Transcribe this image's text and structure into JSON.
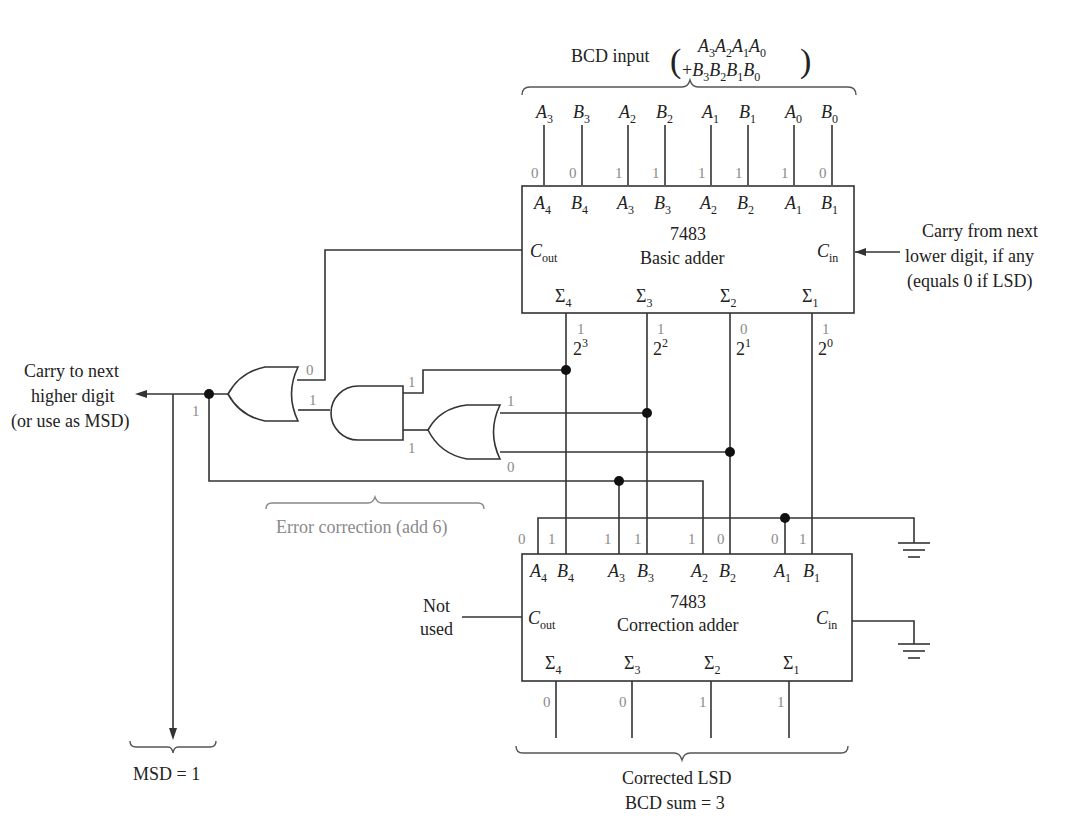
{
  "bcd_input": {
    "label": "BCD input",
    "line1": "A3A2A1A0",
    "line2": "+B3B2B1B0",
    "pins": [
      {
        "letter": "A",
        "sub": "3",
        "bit": "0"
      },
      {
        "letter": "B",
        "sub": "3",
        "bit": "0"
      },
      {
        "letter": "A",
        "sub": "2",
        "bit": "1"
      },
      {
        "letter": "B",
        "sub": "2",
        "bit": "1"
      },
      {
        "letter": "A",
        "sub": "1",
        "bit": "1"
      },
      {
        "letter": "B",
        "sub": "1",
        "bit": "1"
      },
      {
        "letter": "A",
        "sub": "0",
        "bit": "1"
      },
      {
        "letter": "B",
        "sub": "0",
        "bit": "0"
      }
    ]
  },
  "basic_adder": {
    "part": "7483",
    "name": "Basic adder",
    "cout": {
      "letter": "C",
      "sub": "out"
    },
    "cin": {
      "letter": "C",
      "sub": "in"
    },
    "inputs": [
      {
        "letter": "A",
        "sub": "4"
      },
      {
        "letter": "B",
        "sub": "4"
      },
      {
        "letter": "A",
        "sub": "3"
      },
      {
        "letter": "B",
        "sub": "3"
      },
      {
        "letter": "A",
        "sub": "2"
      },
      {
        "letter": "B",
        "sub": "2"
      },
      {
        "letter": "A",
        "sub": "1"
      },
      {
        "letter": "B",
        "sub": "1"
      }
    ],
    "outputs": [
      {
        "sigma_sub": "4",
        "bit": "1",
        "weight": "2",
        "exp": "3"
      },
      {
        "sigma_sub": "3",
        "bit": "1",
        "weight": "2",
        "exp": "2"
      },
      {
        "sigma_sub": "2",
        "bit": "0",
        "weight": "2",
        "exp": "1"
      },
      {
        "sigma_sub": "1",
        "bit": "1",
        "weight": "2",
        "exp": "0"
      }
    ],
    "cout_bit": "0"
  },
  "carry_in_note": {
    "line1": "Carry from next",
    "line2": "lower digit, if any",
    "line3": "(equals 0 if LSD)"
  },
  "carry_out_note": {
    "line1": "Carry to next",
    "line2": "higher digit",
    "line3": "(or use as MSD)",
    "bit": "1"
  },
  "error_correction": {
    "label": "Error correction (add 6)",
    "or_out_in_bit": "1",
    "and_out_bit": "1",
    "and_in_top_bit": "1",
    "and_in_bottom_bit": "1",
    "or2_in_top_bit": "1",
    "or2_in_bottom_bit": "0"
  },
  "correction_adder": {
    "part": "7483",
    "name": "Correction adder",
    "cout": {
      "letter": "C",
      "sub": "out"
    },
    "cin": {
      "letter": "C",
      "sub": "in"
    },
    "not_used_line1": "Not",
    "not_used_line2": "used",
    "inputs": [
      {
        "letter": "A",
        "sub": "4",
        "bit": "0"
      },
      {
        "letter": "B",
        "sub": "4",
        "bit": "1"
      },
      {
        "letter": "A",
        "sub": "3",
        "bit": "1"
      },
      {
        "letter": "B",
        "sub": "3",
        "bit": "1"
      },
      {
        "letter": "A",
        "sub": "2",
        "bit": "1"
      },
      {
        "letter": "B",
        "sub": "2",
        "bit": "0"
      },
      {
        "letter": "A",
        "sub": "1",
        "bit": "0"
      },
      {
        "letter": "B",
        "sub": "1",
        "bit": "1"
      }
    ],
    "outputs": [
      {
        "sigma_sub": "4",
        "bit": "0"
      },
      {
        "sigma_sub": "3",
        "bit": "0"
      },
      {
        "sigma_sub": "2",
        "bit": "1"
      },
      {
        "sigma_sub": "1",
        "bit": "1"
      }
    ]
  },
  "result": {
    "lsd_line1": "Corrected LSD",
    "lsd_line2": "BCD sum = 3",
    "msd": "MSD = 1"
  },
  "symbols": {
    "sigma": "Σ",
    "lparen": "(",
    "rparen": ")"
  }
}
